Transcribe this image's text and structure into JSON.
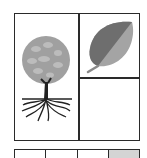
{
  "diagram": {
    "panels": [
      {
        "name": "tree",
        "icon": "tree-with-roots-icon"
      },
      {
        "name": "leaf",
        "icon": "leaf-icon"
      },
      {
        "name": "empty",
        "icon": ""
      }
    ],
    "bottom_row": {
      "cells": [
        {
          "shaded": false
        },
        {
          "shaded": false
        },
        {
          "shaded": false
        },
        {
          "shaded": true
        }
      ]
    },
    "colors": {
      "border": "#2a2a2a",
      "tree_crown": "#a0a0a0",
      "tree_crown_highlight": "#bcbcbc",
      "trunk": "#222222",
      "leaf_dark": "#6e6e6e",
      "leaf_light": "#a4a4a4",
      "shaded_cell": "#d4d4d4"
    }
  }
}
